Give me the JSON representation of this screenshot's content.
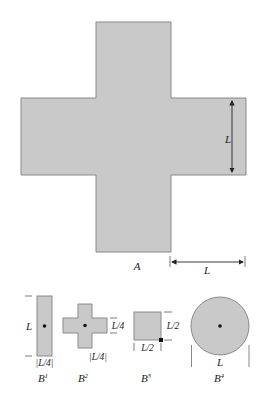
{
  "colors": {
    "fill": "#c9c9c9",
    "stroke": "#8a8a8a",
    "ink": "#222222",
    "background": "#ffffff"
  },
  "main_shape": {
    "name": "A",
    "label": "A",
    "shape": "plus-cross",
    "dimension_labels": {
      "arm_width": "L",
      "arm_length": "L"
    }
  },
  "structuring_elements": [
    {
      "name": "B1",
      "base": "B",
      "superscript": "1",
      "shape": "rectangle",
      "origin": "center",
      "height_label": "L",
      "width_label": "|L/4|"
    },
    {
      "name": "B2",
      "base": "B",
      "superscript": "2",
      "shape": "plus-cross",
      "origin": "center",
      "arm_label": "L/4",
      "width_label": "|L/4|"
    },
    {
      "name": "B3",
      "base": "B",
      "superscript": "3",
      "shape": "square",
      "origin": "bottom-right-corner",
      "height_label": "L/2",
      "width_label": "L/2"
    },
    {
      "name": "B4",
      "base": "B",
      "superscript": "4",
      "shape": "disk",
      "origin": "center",
      "diameter_label": "L"
    }
  ]
}
